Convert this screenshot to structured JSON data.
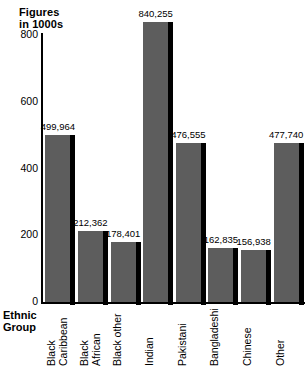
{
  "chart_data": {
    "type": "bar",
    "title": "Figures in 1000s",
    "title_line1": "Figures",
    "title_line2": "in 1000s",
    "xlabel": "Ethnic Group",
    "xlabel_line1": "Ethnic",
    "xlabel_line2": "Group",
    "ylabel": "Figures in 1000s",
    "ylim": [
      0,
      800
    ],
    "yticks": [
      0,
      200,
      400,
      600,
      800
    ],
    "ytick_labels": [
      "0",
      "200",
      "400",
      "600",
      "800"
    ],
    "grid": false,
    "legend": false,
    "bar_color": "#5d5d5d",
    "bar_edge_color": "#000000",
    "background": "#ffffff",
    "categories": [
      "Black Caribbean",
      "Black African",
      "Black other",
      "Indian",
      "Pakistani",
      "Bangladeshi",
      "Chinese",
      "Other"
    ],
    "category_lines": [
      [
        "Black",
        "Caribbean"
      ],
      [
        "Black",
        "African"
      ],
      [
        "Black other"
      ],
      [
        "Indian"
      ],
      [
        "Pakistani"
      ],
      [
        "Bangladeshi"
      ],
      [
        "Chinese"
      ],
      [
        "Other"
      ]
    ],
    "values": [
      499964,
      212362,
      178401,
      840255,
      476555,
      162835,
      156938,
      477740
    ],
    "values_thousands": [
      499.964,
      212.362,
      178.401,
      840.255,
      476.555,
      162.835,
      156.938,
      477.74
    ],
    "data_labels": [
      "499,964",
      "212,362",
      "178,401",
      "840,255",
      "476,555",
      "162,835",
      "156,938",
      "477,740"
    ]
  }
}
